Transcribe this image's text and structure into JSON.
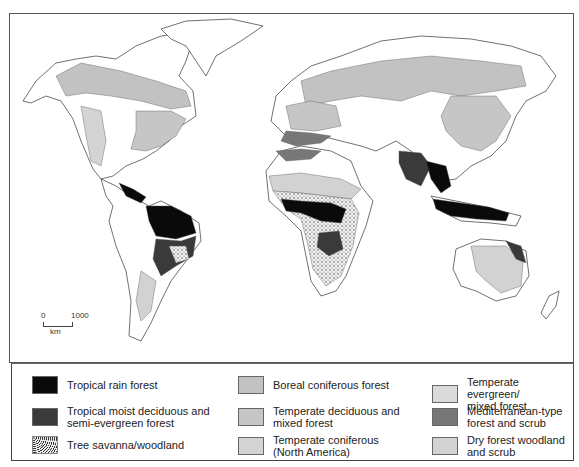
{
  "map": {
    "title": "",
    "scale_bar": {
      "start": "0",
      "end": "1000",
      "unit": "km"
    }
  },
  "colors": {
    "tropical_rain_forest": "#0a0a0a",
    "tropical_moist_deciduous": "#3a3a3a",
    "tree_savanna": "#dcdcdc",
    "boreal_coniferous": "#c2c2c2",
    "temperate_deciduous": "#c6c6c6",
    "temperate_coniferous_na": "#d4d4d4",
    "temperate_evergreen": "#dadada",
    "mediterranean": "#777777",
    "dry_forest": "#d2d2d2",
    "outline": "#333333"
  },
  "legend": {
    "items": [
      {
        "label": "Tropical rain forest",
        "swatch": "#0a0a0a",
        "pattern": "solid"
      },
      {
        "label": "Tropical moist deciduous and\nsemi-evergreen forest",
        "swatch": "#3a3a3a",
        "pattern": "solid"
      },
      {
        "label": "Tree savanna/woodland",
        "swatch": "#dcdcdc",
        "pattern": "stipple"
      },
      {
        "label": "Boreal coniferous forest",
        "swatch": "#c2c2c2",
        "pattern": "solid"
      },
      {
        "label": "Temperate deciduous and\nmixed forest",
        "swatch": "#c6c6c6",
        "pattern": "solid"
      },
      {
        "label": "Temperate coniferous\n(North America)",
        "swatch": "#d4d4d4",
        "pattern": "solid"
      },
      {
        "label": "Temperate evergreen/\nmixed forest",
        "swatch": "#dadada",
        "pattern": "solid"
      },
      {
        "label": "Mediterranean-type\nforest and scrub",
        "swatch": "#777777",
        "pattern": "solid"
      },
      {
        "label": "Dry forest woodland\nand scrub",
        "swatch": "#d2d2d2",
        "pattern": "solid"
      }
    ]
  }
}
